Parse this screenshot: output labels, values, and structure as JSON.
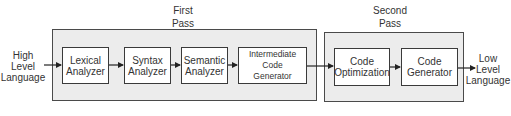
{
  "diagram": {
    "input_label": [
      "High",
      "Level",
      "Language"
    ],
    "output_label": [
      "Low",
      "Level",
      "Language"
    ],
    "passes": [
      {
        "title": [
          "First",
          "Pass"
        ],
        "stages": [
          {
            "lines": [
              "Lexical",
              "Analyzer"
            ]
          },
          {
            "lines": [
              "Syntax",
              "Analyzer"
            ]
          },
          {
            "lines": [
              "Semantic",
              "Analyzer"
            ]
          },
          {
            "lines": [
              "Intermediate Code",
              "Generator"
            ]
          }
        ]
      },
      {
        "title": [
          "Second",
          "Pass"
        ],
        "stages": [
          {
            "lines": [
              "Code",
              "Optimization"
            ]
          },
          {
            "lines": [
              "Code",
              "Generator"
            ]
          }
        ]
      }
    ],
    "colors": {
      "pass_fill": "#ececec",
      "box_fill": "#ffffff",
      "stroke": "#3a3a3a"
    }
  }
}
